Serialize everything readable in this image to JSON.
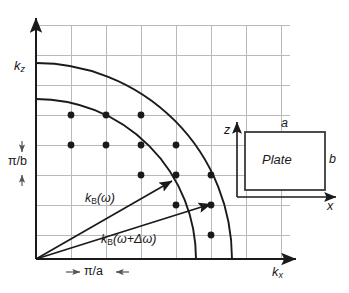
{
  "figure": {
    "type": "k-space-brillouin-diagram",
    "background": "#ffffff",
    "ink": "#1a1a1a",
    "grid_color": "#b9b9b9"
  },
  "axes": {
    "x_label": "k",
    "x_sub": "x",
    "y_label": "k",
    "y_sub": "z",
    "origin_px": [
      36,
      259
    ],
    "x_axis_end_px": [
      300,
      259
    ],
    "y_axis_top_px": [
      36,
      14
    ]
  },
  "grid": {
    "x_spacing_px": 35,
    "y_spacing_px": 30,
    "n_vertical": 7,
    "n_horizontal": 7,
    "note": "reciprocal lattice grid of spacing pi/a by pi/b"
  },
  "spacing_labels": {
    "horizontal": {
      "text": "π/a",
      "left_arrow": "→",
      "right_arrow": "←",
      "meaning": "grid cell width"
    },
    "vertical": {
      "text": "π/b",
      "top_arrow": "↓",
      "bottom_arrow": "↑",
      "meaning": "grid cell height"
    }
  },
  "arcs": [
    {
      "name": "inner-arc",
      "label_key": "k_B_omega",
      "radius_px": 160
    },
    {
      "name": "outer-arc",
      "label_key": "k_B_omega_delta",
      "radius_px": 196
    }
  ],
  "vectors": [
    {
      "name": "k_B_omega",
      "label_main": "k",
      "label_sub": "B",
      "label_arg": "(ω)",
      "full_text": "k_B(ω)",
      "from_px": [
        36,
        259
      ],
      "to_px": [
        174,
        180
      ]
    },
    {
      "name": "k_B_omega_delta",
      "label_main": "k",
      "label_sub": "B",
      "label_arg": "(ω+Δω)",
      "full_text": "k_B(ω+Δω)",
      "from_px": [
        36,
        259
      ],
      "to_px": [
        213,
        203
      ]
    }
  ],
  "mode_points": {
    "description": "allowed lattice modes between the two arcs",
    "radius_px": 3.4,
    "points": [
      [
        71,
        115
      ],
      [
        106,
        115
      ],
      [
        141,
        115
      ],
      [
        71,
        145
      ],
      [
        106,
        145
      ],
      [
        141,
        145
      ],
      [
        141,
        175
      ],
      [
        176,
        145
      ],
      [
        176,
        175
      ],
      [
        176,
        205
      ],
      [
        211,
        175
      ],
      [
        211,
        205
      ],
      [
        211,
        235
      ]
    ]
  },
  "inset": {
    "name": "plate-inset",
    "body_label": "Plate",
    "top_dimension": "a",
    "right_dimension": "b",
    "axis_vertical": "z",
    "axis_horizontal": "x",
    "rect_px": [
      245,
      132,
      80,
      58
    ]
  }
}
